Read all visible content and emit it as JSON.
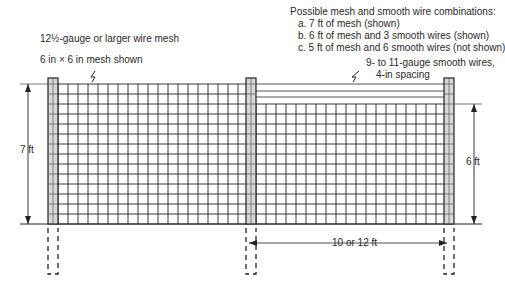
{
  "labels": {
    "mesh_gauge": "12½-gauge or larger wire mesh",
    "mesh_size": "6 in × 6 in mesh shown",
    "combos_title": "Possible mesh and smooth wire combinations:",
    "combo_a": "a. 7 ft of mesh (shown)",
    "combo_b": "b. 6 ft of mesh and 3 smooth wires (shown)",
    "combo_c": "c. 5 ft of mesh and 6 smooth wires (not shown)",
    "smooth_wire_1": "9- to 11-gauge smooth wires,",
    "smooth_wire_2": "4-in spacing",
    "height_left": "7 ft",
    "height_right": "6 ft",
    "post_spacing": "10 or 12 ft"
  },
  "geometry": {
    "ground_y": 224,
    "posts_x": [
      48,
      246,
      444
    ],
    "post_width": 10,
    "left_mesh_top": 84,
    "right_mesh_top": 104,
    "smooth_wires_y": [
      84,
      91,
      97
    ],
    "grid_spacing": 10
  },
  "colors": {
    "line": "#222222",
    "post_fill": "#d8d8d8"
  }
}
